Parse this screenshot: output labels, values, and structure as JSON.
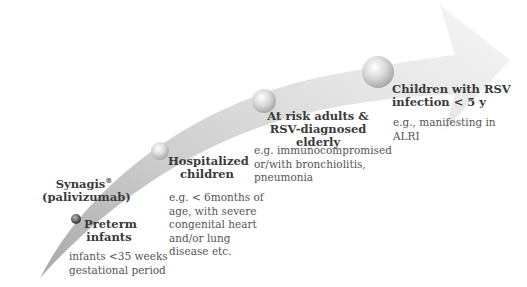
{
  "product": {
    "name": "Synagis",
    "mark": "®",
    "generic": "(palivizumab)"
  },
  "stages": [
    {
      "title_line1": "Preterm",
      "title_line2": "infants",
      "desc_lines": [
        "infants <35 weeks",
        "gestational period"
      ]
    },
    {
      "title_line1": "Hospitalized",
      "title_line2": "children",
      "desc_lines": [
        "e.g. < 6months of",
        "age, with severe",
        "congenital heart",
        "and/or lung",
        "disease etc."
      ]
    },
    {
      "title_line1": "At risk adults &",
      "title_line2": "RSV-diagnosed elderly",
      "desc_lines": [
        "e.g. immunocompromised",
        "or/with bronchiolitis,",
        "pneumonia"
      ]
    },
    {
      "title_line1": "Children with RSV",
      "title_line2": "infection < 5 y",
      "desc_lines": [
        "e.g., manifesting in",
        "ALRI"
      ]
    }
  ],
  "colors": {
    "arrow_light": "#f4f4f4",
    "arrow_dark": "#b8b8b8",
    "bubble": "#cfcfcf",
    "text_title": "#3a3a3a",
    "text_desc": "#555555"
  }
}
